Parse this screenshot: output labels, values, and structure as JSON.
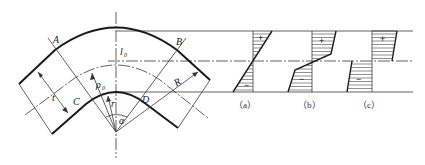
{
  "figure": {
    "point_labels": {
      "A": "A",
      "B": "B",
      "C": "C",
      "D": "D"
    },
    "dimension_labels": {
      "l0": "l",
      "l0_sub": "0",
      "rho0": "ρ",
      "rho0_sub": "0",
      "R": "R",
      "r": "r",
      "t": "t",
      "alpha": "α"
    },
    "stress_diagrams": [
      {
        "caption": "（a）",
        "top_sign": "+",
        "bottom_sign": "−"
      },
      {
        "caption": "（b）",
        "top_sign": "+",
        "bottom_sign": "−"
      },
      {
        "caption": "（c）",
        "top_sign": "+",
        "bottom_sign": "−"
      }
    ]
  }
}
